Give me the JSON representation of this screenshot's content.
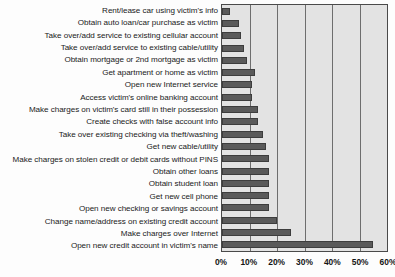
{
  "chart_data": {
    "type": "bar",
    "orientation": "horizontal",
    "title": "",
    "subtitle": "",
    "xlabel": "",
    "ylabel": "",
    "xlim": [
      0,
      60
    ],
    "xunit": "%",
    "grid": true,
    "legend": null,
    "tick_labels": [
      "0%",
      "10%",
      "20%",
      "30%",
      "40%",
      "50%",
      "60%"
    ],
    "tick_values": [
      0,
      10,
      20,
      30,
      40,
      50,
      60
    ],
    "categories": [
      "Rent/lease car using victim's info",
      "Obtain auto loan/car purchase as victim",
      "Take over/add service to existing cellular account",
      "Take over/add service to existing cable/utility",
      "Obtain mortgage or 2nd mortgage as victim",
      "Get apartment or home as victim",
      "Open new Internet service",
      "Access victim's online banking account",
      "Make charges on victim's card still in their possession",
      "Create checks with false account info",
      "Take over existing checking via theft/washing",
      "Get new cable/utility",
      "Make charges on stolen credit or debit cards without PINS",
      "Obtain other loans",
      "Obtain student loan",
      "Get new cell phone",
      "Open new checking or savings account",
      "Change name/address on existing credit account",
      "Make charges over Internet",
      "Open new credit account in victim's name"
    ],
    "values": [
      3,
      6,
      7,
      8,
      9,
      12,
      11,
      11,
      13,
      13,
      15,
      16,
      17,
      17,
      17,
      17,
      17,
      20,
      25,
      55
    ],
    "colors": {
      "bar": "#5a5a5a",
      "bar_border": "#3d3d3d",
      "plot_background": "#e3e3e3",
      "gridline": "#6e6e6e",
      "axis_border": "#4a4a4a",
      "text": "#1a1a1a",
      "page_background": "#fdfdfd"
    }
  }
}
